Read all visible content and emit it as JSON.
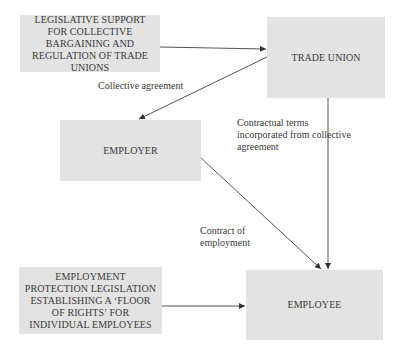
{
  "nodes": {
    "legislative_support": "LEGISLATIVE SUPPORT FOR COLLECTIVE BARGAINING AND REGULATION OF TRADE UNIONS",
    "trade_union": "TRADE UNION",
    "employer": "EMPLOYER",
    "employment_protection": "EMPLOYMENT PROTECTION LEGISLATION ESTABLISHING A ‘FLOOR OF RIGHTS’ FOR INDIVIDUAL EMPLOYEES",
    "employee": "EMPLOYEE"
  },
  "edge_labels": {
    "collective_agreement": "Collective agreement",
    "contractual_terms": "Contractual terms incorporated from collective agreement",
    "contract_of_employment": "Contract of employment"
  },
  "edges": [
    {
      "from": "legislative_support",
      "to": "trade_union"
    },
    {
      "from": "trade_union",
      "to": "employer",
      "label": "collective_agreement"
    },
    {
      "from": "trade_union",
      "to": "employee",
      "label": "contractual_terms"
    },
    {
      "from": "employer",
      "to": "employee",
      "label": "contract_of_employment"
    },
    {
      "from": "employment_protection",
      "to": "employee"
    }
  ],
  "colors": {
    "box_fill": "#e3e3e3",
    "line": "#555555",
    "text": "#3a3a3a"
  }
}
